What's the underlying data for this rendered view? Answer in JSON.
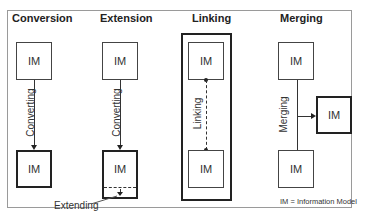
{
  "diagram": {
    "box_label": "IM",
    "legend": "IM = Information Model",
    "panels": [
      {
        "title": "Conversion",
        "edge_label": "Converting"
      },
      {
        "title": "Extension",
        "edge_label": "Converting",
        "extra_label": "Extending"
      },
      {
        "title": "Linking",
        "edge_label": "Linking"
      },
      {
        "title": "Merging",
        "edge_label": "Merging"
      }
    ]
  }
}
